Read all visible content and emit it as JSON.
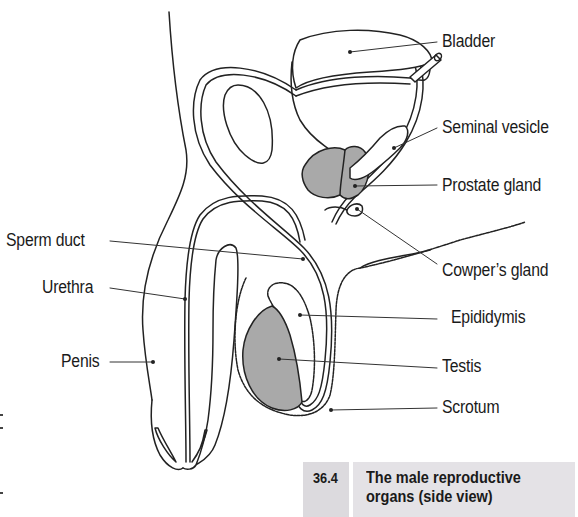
{
  "figure": {
    "number": "36.4",
    "caption_line1": "The male reproductive",
    "caption_line2": "organs (side view)"
  },
  "labels": {
    "bladder": "Bladder",
    "seminal_vesicle": "Seminal vesicle",
    "prostate_gland": "Prostate gland",
    "cowpers_gland": "Cowper’s gland",
    "sperm_duct": "Sperm duct",
    "urethra": "Urethra",
    "epididymis": "Epididymis",
    "penis": "Penis",
    "testis": "Testis",
    "scrotum": "Scrotum"
  },
  "colors": {
    "line": "#222222",
    "organ_fill": "#a9a9a9",
    "caption_bg": "#e4e2e6"
  }
}
